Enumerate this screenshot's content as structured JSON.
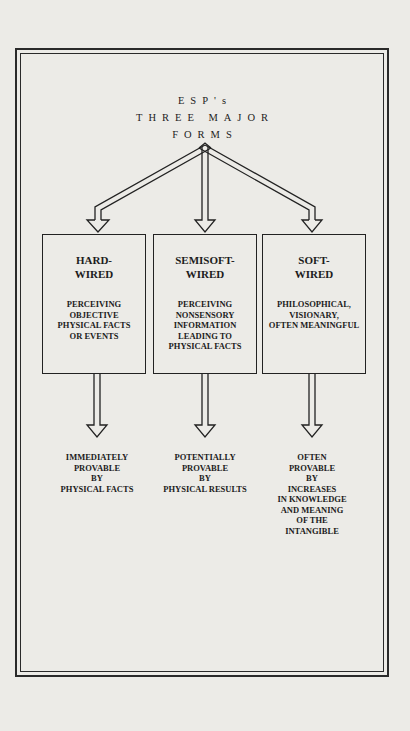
{
  "diagram": {
    "title": {
      "line1": "ESP's",
      "line2": "THREE MAJOR",
      "line3": "FORMS"
    },
    "forms": [
      {
        "name_line1": "HARD-",
        "name_line2": "WIRED",
        "description": [
          "PERCEIVING",
          "OBJECTIVE",
          "PHYSICAL FACTS",
          "OR EVENTS"
        ],
        "outcome": [
          "IMMEDIATELY",
          "PROVABLE",
          "BY",
          "PHYSICAL FACTS"
        ]
      },
      {
        "name_line1": "SEMISOFT-",
        "name_line2": "WIRED",
        "description": [
          "PERCEIVING",
          "NONSENSORY",
          "INFORMATION",
          "LEADING TO",
          "PHYSICAL FACTS"
        ],
        "outcome": [
          "POTENTIALLY",
          "PROVABLE",
          "BY",
          "PHYSICAL RESULTS"
        ]
      },
      {
        "name_line1": "SOFT-",
        "name_line2": "WIRED",
        "description": [
          "PHILOSOPHICAL,",
          "VISIONARY,",
          "OFTEN MEANINGFUL"
        ],
        "outcome": [
          "OFTEN",
          "PROVABLE",
          "BY",
          "INCREASES",
          "IN KNOWLEDGE",
          "AND MEANING",
          "OF THE",
          "INTANGIBLE"
        ]
      }
    ]
  }
}
